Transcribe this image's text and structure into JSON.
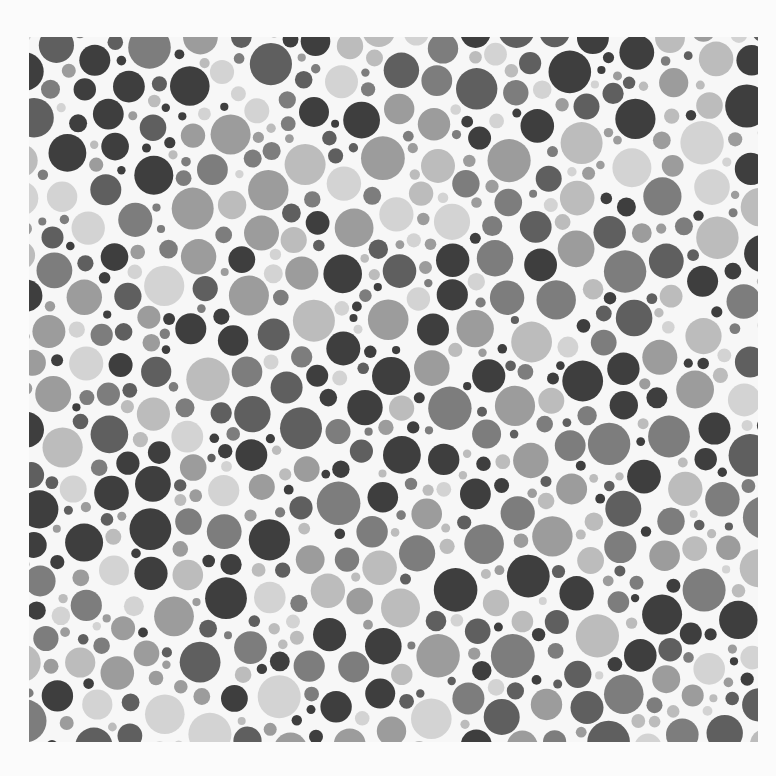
{
  "image": {
    "description": "Grayscale color-vision test plate composed of randomly packed dots of varying size and gray tone",
    "background": "#fbfbfb",
    "plate_bg": "#f7f7f7",
    "plate": {
      "x": 29,
      "y": 37,
      "width": 729,
      "height": 705
    },
    "tones": [
      "#3e3e3e",
      "#5f5f5f",
      "#7d7d7d",
      "#9c9c9c",
      "#bcbcbc",
      "#d3d3d3"
    ],
    "tone_weights": [
      0.22,
      0.16,
      0.16,
      0.18,
      0.16,
      0.12
    ],
    "dot_radius_range": [
      4,
      22
    ],
    "seed": 7331
  }
}
